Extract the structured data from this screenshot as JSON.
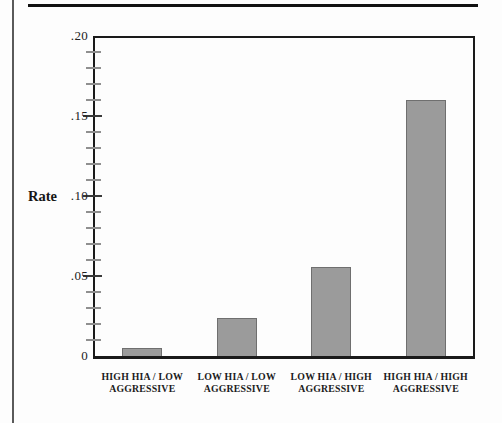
{
  "page": {
    "background": "#fdfdfd",
    "left_rule_color": "#5a5a5a",
    "top_rule_color": "#111111"
  },
  "chart_data": {
    "type": "bar",
    "title": "",
    "xlabel": "",
    "ylabel": "Rate",
    "categories": [
      "HIGH HIA / LOW\nAGGRESSIVE",
      "LOW HIA / LOW\nAGGRESSIVE",
      "LOW HIA / HIGH\nAGGRESSIVE",
      "HIGH HIA / HIGH\nAGGRESSIVE"
    ],
    "values": [
      0.005,
      0.024,
      0.056,
      0.161
    ],
    "ylim": [
      0,
      0.2
    ],
    "yticks": [
      {
        "value": 0.2,
        "label": ".20"
      },
      {
        "value": 0.15,
        "label": ".15"
      },
      {
        "value": 0.1,
        "label": ".10"
      },
      {
        "value": 0.05,
        "label": ".05"
      },
      {
        "value": 0.0,
        "label": "0"
      }
    ],
    "minor_tick_step": 0.01,
    "grid": false,
    "legend": "none",
    "bar_fill": "#9b9b9b",
    "bar_border": "#6f6f6f",
    "axis_color": "#1a1a1a",
    "tick_color_major": "#3a3a3a",
    "tick_color_minor": "#8f8f8f"
  }
}
